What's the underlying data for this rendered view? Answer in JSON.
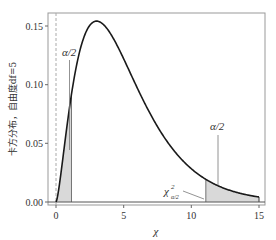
{
  "chart_data": {
    "type": "line",
    "title": "",
    "xlabel": "χ",
    "ylabel": "卡方分布，自由度df=5",
    "xlim": [
      -1,
      15.5
    ],
    "ylim": [
      -0.005,
      0.16
    ],
    "xticks": [
      0,
      5,
      10,
      15
    ],
    "xtick_labels": [
      "0",
      "5",
      "10",
      "15"
    ],
    "yticks": [
      0.0,
      0.05,
      0.1,
      0.15
    ],
    "ytick_labels": [
      "0.00",
      "0.05",
      "0.10",
      "0.15"
    ],
    "grid": false,
    "legend": null,
    "series": [
      {
        "name": "chi-square pdf df=5",
        "df": 5,
        "x_range": [
          0,
          15
        ],
        "x": [
          0,
          0.5,
          1,
          1.5,
          2,
          2.5,
          3,
          3.5,
          4,
          5,
          6,
          7,
          8,
          9,
          10,
          11,
          12,
          13,
          14,
          15
        ],
        "y": [
          0,
          0.0366,
          0.0807,
          0.1151,
          0.1384,
          0.1512,
          0.1542,
          0.153,
          0.1465,
          0.1219,
          0.0907,
          0.0655,
          0.0447,
          0.0296,
          0.0188,
          0.0119,
          0.0072,
          0.0044,
          0.0026,
          0.0015
        ],
        "color": "#1a1a1a"
      }
    ],
    "shaded_regions": [
      {
        "name": "lower tail",
        "x_from": 0,
        "x_to": 1.145,
        "label": "α/2",
        "color": "#d9d9d9"
      },
      {
        "name": "upper tail",
        "x_from": 11.07,
        "x_to": 15,
        "label": "α/2",
        "color": "#d9d9d9"
      }
    ],
    "vertical_reference_line": {
      "x": 0,
      "style": "dashed",
      "color": "#aaaaaa"
    },
    "annotations": [
      {
        "text": "α/2",
        "target": "lower tail"
      },
      {
        "text": "α/2",
        "target": "upper tail"
      },
      {
        "text": "χ²α/2",
        "base": "χ",
        "sup": "2",
        "sub": "α/2",
        "target": "upper critical value"
      }
    ]
  },
  "labels": {
    "ylabel": "卡方分布，自由度df=5",
    "xlabel": "χ",
    "alpha_half_left": "α/2",
    "alpha_half_right": "α/2",
    "chi_base": "χ",
    "chi_sup": "2",
    "chi_sub": "α/2",
    "xtick_0": "0",
    "xtick_5": "5",
    "xtick_10": "10",
    "xtick_15": "15",
    "ytick_000": "0.00",
    "ytick_005": "0.05",
    "ytick_010": "0.10",
    "ytick_015": "0.15"
  }
}
